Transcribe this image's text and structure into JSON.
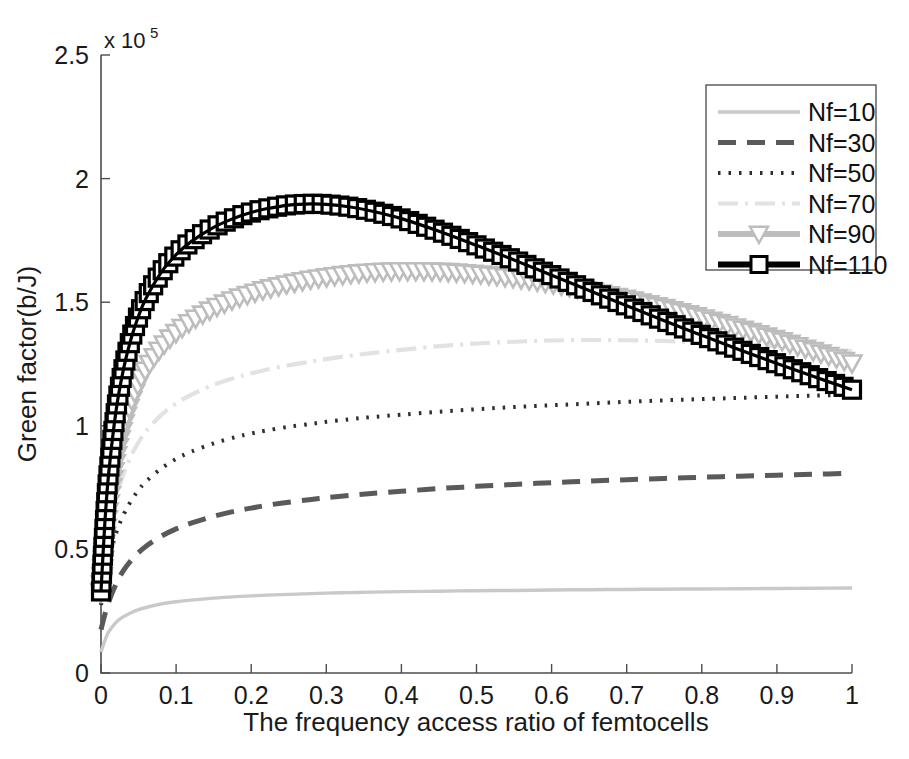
{
  "chart_data": {
    "type": "line",
    "title": "",
    "xlabel": "The frequency access ratio of femtocells",
    "ylabel": "Green factor(b/J)",
    "y_exponent_prefix": "x 10",
    "y_exponent_power": "5",
    "xlim": [
      0,
      1
    ],
    "ylim": [
      0,
      2.5
    ],
    "xticks": [
      "0",
      "0.1",
      "0.2",
      "0.3",
      "0.4",
      "0.5",
      "0.6",
      "0.7",
      "0.8",
      "0.9",
      "1"
    ],
    "xtick_values": [
      0,
      0.1,
      0.2,
      0.3,
      0.4,
      0.5,
      0.6,
      0.7,
      0.8,
      0.9,
      1
    ],
    "yticks": [
      "0",
      "0.5",
      "1",
      "1.5",
      "2",
      "2.5"
    ],
    "ytick_values": [
      0,
      0.5,
      1,
      1.5,
      2,
      2.5
    ],
    "grid": false,
    "legend_position": "top-right",
    "x": [
      0,
      0.005,
      0.01,
      0.02,
      0.03,
      0.04,
      0.05,
      0.06,
      0.08,
      0.1,
      0.12,
      0.15,
      0.18,
      0.2,
      0.22,
      0.25,
      0.28,
      0.3,
      0.33,
      0.36,
      0.4,
      0.45,
      0.5,
      0.55,
      0.6,
      0.65,
      0.7,
      0.75,
      0.8,
      0.85,
      0.9,
      0.95,
      1
    ],
    "series": [
      {
        "name": "Nf=10",
        "label": "Nf=10",
        "color": "#c9c9c9",
        "width": 3.4,
        "dash": "none",
        "marker": "none",
        "values": [
          0.085,
          0.13,
          0.165,
          0.205,
          0.228,
          0.244,
          0.256,
          0.265,
          0.279,
          0.288,
          0.295,
          0.303,
          0.309,
          0.312,
          0.315,
          0.318,
          0.321,
          0.323,
          0.325,
          0.327,
          0.329,
          0.331,
          0.333,
          0.334,
          0.336,
          0.337,
          0.338,
          0.339,
          0.34,
          0.341,
          0.342,
          0.343,
          0.344
        ]
      },
      {
        "name": "Nf=30",
        "label": "Nf=30",
        "color": "#5a5a5a",
        "width": 5.0,
        "dash": "18,11",
        "marker": "none",
        "values": [
          0.175,
          0.235,
          0.285,
          0.36,
          0.415,
          0.455,
          0.487,
          0.513,
          0.553,
          0.583,
          0.606,
          0.634,
          0.656,
          0.667,
          0.678,
          0.691,
          0.702,
          0.709,
          0.718,
          0.726,
          0.735,
          0.746,
          0.755,
          0.763,
          0.77,
          0.776,
          0.782,
          0.787,
          0.792,
          0.796,
          0.8,
          0.804,
          0.808
        ]
      },
      {
        "name": "Nf=50",
        "label": "Nf=50",
        "color": "#2e2e2e",
        "width": 4.0,
        "dash": "2.5,8",
        "marker": "none",
        "values": [
          0.275,
          0.375,
          0.455,
          0.565,
          0.64,
          0.696,
          0.74,
          0.775,
          0.827,
          0.866,
          0.895,
          0.929,
          0.955,
          0.969,
          0.981,
          0.996,
          1.008,
          1.016,
          1.026,
          1.035,
          1.045,
          1.057,
          1.067,
          1.076,
          1.083,
          1.09,
          1.097,
          1.103,
          1.108,
          1.113,
          1.118,
          1.122,
          1.126
        ]
      },
      {
        "name": "Nf=70",
        "label": "Nf=70",
        "color": "#e2e2e2",
        "width": 4.2,
        "dash": "20,7,3,7",
        "marker": "none",
        "values": [
          0.305,
          0.445,
          0.555,
          0.705,
          0.805,
          0.878,
          0.934,
          0.978,
          1.043,
          1.09,
          1.125,
          1.166,
          1.196,
          1.212,
          1.227,
          1.245,
          1.26,
          1.27,
          1.283,
          1.294,
          1.307,
          1.322,
          1.333,
          1.34,
          1.345,
          1.347,
          1.346,
          1.343,
          1.338,
          1.331,
          1.323,
          1.313,
          1.302
        ]
      },
      {
        "name": "Nf=90",
        "label": "Nf=90",
        "color": "#bdbdbd",
        "width": 8.5,
        "dash": "none",
        "marker": "triangle-down",
        "values": [
          0.325,
          0.52,
          0.665,
          0.865,
          1.0,
          1.096,
          1.17,
          1.228,
          1.314,
          1.375,
          1.421,
          1.474,
          1.513,
          1.533,
          1.551,
          1.573,
          1.591,
          1.6,
          1.612,
          1.62,
          1.625,
          1.623,
          1.613,
          1.596,
          1.573,
          1.545,
          1.512,
          1.476,
          1.436,
          1.393,
          1.348,
          1.3,
          1.252
        ]
      },
      {
        "name": "Nf=110",
        "label": "Nf=110",
        "color": "#000000",
        "width": 9.5,
        "dash": "none",
        "marker": "square",
        "values": [
          0.33,
          0.6,
          0.8,
          1.06,
          1.23,
          1.352,
          1.444,
          1.516,
          1.62,
          1.692,
          1.745,
          1.803,
          1.843,
          1.863,
          1.878,
          1.893,
          1.898,
          1.896,
          1.886,
          1.869,
          1.838,
          1.787,
          1.73,
          1.671,
          1.609,
          1.547,
          1.486,
          1.425,
          1.366,
          1.308,
          1.252,
          1.198,
          1.146
        ]
      }
    ]
  },
  "legend": {
    "entries": [
      "Nf=10",
      "Nf=30",
      "Nf=50",
      "Nf=70",
      "Nf=90",
      "Nf=110"
    ]
  }
}
